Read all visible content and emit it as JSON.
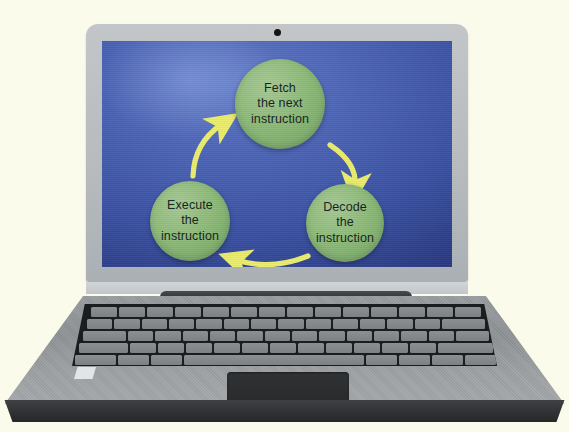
{
  "scene": {
    "title": "Fetch-Decode-Execute cycle shown on a laptop screen",
    "background_color": "#fbfbec"
  },
  "laptop": {
    "lid_color": "#b7bbbe",
    "base_color": "#93979a",
    "base_front_color": "#2f3133",
    "keyboard_color": "#1b1c1e",
    "key_color": "#858a8d",
    "webcam": {
      "name": "webcam-lens",
      "color": "#141414"
    },
    "hinge": {
      "name": "hinge-bar",
      "color": "#333335"
    },
    "trackpad": {
      "name": "trackpad",
      "color": "#2b2d2f"
    },
    "sticker": {
      "name": "badge-sticker",
      "color": "#e2e5e6"
    }
  },
  "screen": {
    "background_color": "#3a51a3",
    "accent_color": "#8dba78",
    "arrow_color": "#e9ec6a",
    "text_color": "#11231a"
  },
  "chart_data": {
    "type": "diagram",
    "layout": "triangular cycle, clockwise",
    "nodes": [
      {
        "id": "fetch",
        "label": "Fetch\nthe next\ninstruction",
        "lines": [
          "Fetch",
          "the next",
          "instruction"
        ],
        "position": "top"
      },
      {
        "id": "decode",
        "label": "Decode\nthe\ninstruction",
        "lines": [
          "Decode",
          "the",
          "instruction"
        ],
        "position": "bottom-right"
      },
      {
        "id": "execute",
        "label": "Execute\nthe\ninstruction",
        "lines": [
          "Execute",
          "the",
          "instruction"
        ],
        "position": "bottom-left"
      }
    ],
    "edges": [
      {
        "from": "fetch",
        "to": "decode",
        "direction": "down-right",
        "style": "curved-arrow"
      },
      {
        "from": "decode",
        "to": "execute",
        "direction": "left",
        "style": "curved-arrow"
      },
      {
        "from": "execute",
        "to": "fetch",
        "direction": "up-right",
        "style": "curved-arrow"
      }
    ],
    "node_shape": "circle",
    "node_fill": "#8dba78",
    "arrow_fill": "#e9ec6a"
  },
  "nodes": {
    "fetch": {
      "line1": "Fetch",
      "line2": "the next",
      "line3": "instruction"
    },
    "decode": {
      "line1": "Decode",
      "line2": "the",
      "line3": "instruction"
    },
    "execute": {
      "line1": "Execute",
      "line2": "the",
      "line3": "instruction"
    }
  }
}
